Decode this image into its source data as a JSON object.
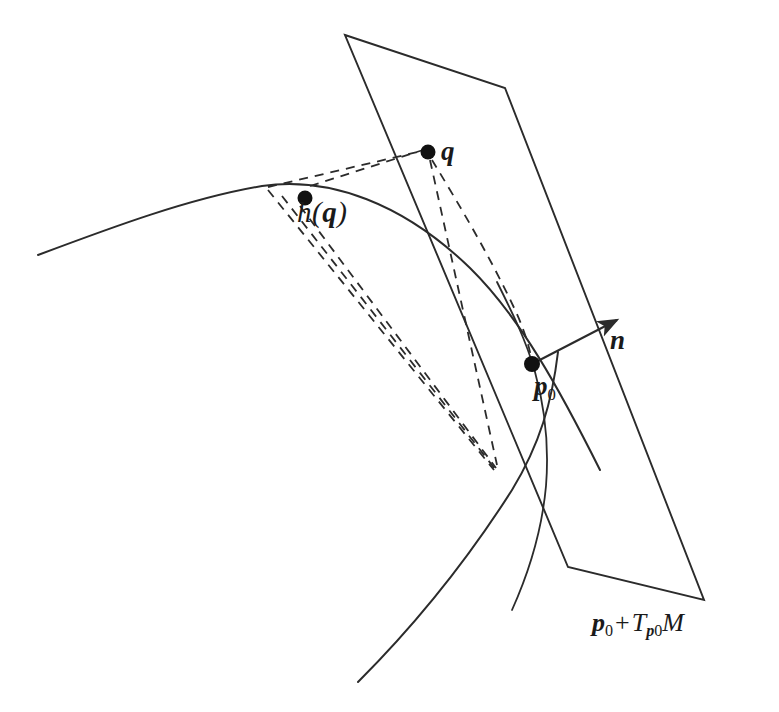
{
  "figure": {
    "kind": "geometry-diagram",
    "background_color": "#ffffff",
    "stroke_color": "#2b2b2b",
    "labels": {
      "point_q": "q",
      "point_hq_h": "h",
      "point_hq_open": "(",
      "point_hq_var": "q",
      "point_hq_close": ")",
      "point_p0_p": "p",
      "point_p0_sub": "0",
      "normal_vector": "n",
      "plane_p": "p",
      "plane_p_sub": "0",
      "plane_plus": "+",
      "plane_T": "T",
      "plane_T_sub_p": "p",
      "plane_T_sub_0": "0",
      "plane_M": "M"
    },
    "points": [
      {
        "name": "q",
        "x": 428,
        "y": 152,
        "radius": 7.5
      },
      {
        "name": "h(q)",
        "x": 305,
        "y": 198,
        "radius": 7.5
      },
      {
        "name": "p0",
        "x": 532,
        "y": 364,
        "radius": 8
      }
    ],
    "tangent_plane": {
      "name": "p0 + Tp0 M",
      "corners": [
        {
          "x": 345,
          "y": 35
        },
        {
          "x": 505,
          "y": 88
        },
        {
          "x": 704,
          "y": 600
        },
        {
          "x": 568,
          "y": 567
        }
      ]
    },
    "normal_arrow": {
      "from_x": 532,
      "from_y": 364,
      "to_x": 617,
      "to_y": 320
    },
    "surface_curve_upper": "M 38 255 C 110 228 190 198 262 186 C 330 176 404 204 470 268 C 520 317 560 390 600 470",
    "surface_curve_lower": "M 358 682 C 420 620 470 556 512 490 C 540 444 552 402 558 352",
    "surface_curve_through_p0": "M 497 282 C 512 312 526 340 535 372 C 545 408 549 448 546 486 C 542 530 530 570 512 610",
    "dashed_lines": [
      {
        "name": "hq-to-q",
        "from_x": 310,
        "from_y": 186,
        "to_x": 423,
        "to_y": 150
      },
      {
        "name": "curve-to-q",
        "from_x": 268,
        "from_y": 187,
        "to_x": 422,
        "to_y": 151
      },
      {
        "name": "q-to-base",
        "from_x": 430,
        "from_y": 160,
        "to_x": 497,
        "to_y": 465
      },
      {
        "name": "curvept-to-base",
        "from_x": 268,
        "from_y": 190,
        "to_x": 494,
        "to_y": 470
      },
      {
        "name": "hqpt-to-base",
        "from_x": 300,
        "from_y": 206,
        "to_x": 496,
        "to_y": 468
      },
      {
        "name": "curvept2-to-base",
        "from_x": 282,
        "from_y": 196,
        "to_x": 495,
        "to_y": 469
      }
    ]
  }
}
